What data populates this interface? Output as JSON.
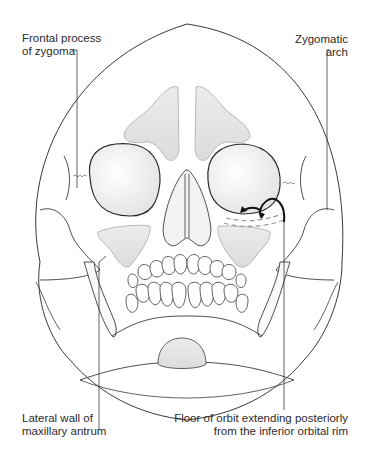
{
  "figure": {
    "labels": {
      "frontal_process": [
        "Frontal process",
        "of zygoma"
      ],
      "zygomatic_arch": [
        "Zygomatic",
        "arch"
      ],
      "lateral_wall": [
        "Lateral wall of",
        "maxillary antrum"
      ],
      "orbit_floor": [
        "Floor of orbit extending posteriorly",
        "from the inferior orbital rim"
      ]
    },
    "colors": {
      "outline": "#3a3a3a",
      "sinus_fill": "#e4e4e4",
      "orbit_fill": "#f2f2f2",
      "arrow": "#111111",
      "dash": "#9a9a9a"
    }
  }
}
